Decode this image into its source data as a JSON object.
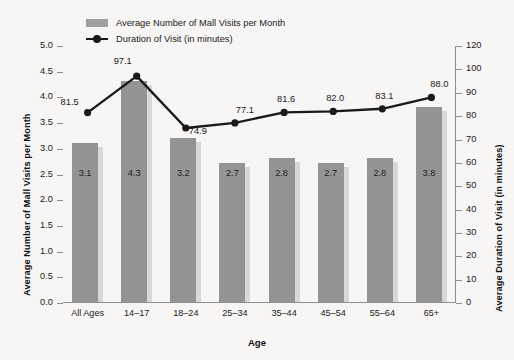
{
  "chart_data": {
    "type": "bar",
    "title": "",
    "xlabel": "Age",
    "ylabel": "Average Number of Mall Visits per Month",
    "y2label": "Average Duration of Visit (in minutes)",
    "categories": [
      "All Ages",
      "14–17",
      "18–24",
      "25–34",
      "35–44",
      "45–54",
      "55–64",
      "65+"
    ],
    "ylim": [
      0,
      5
    ],
    "y2lim": [
      0,
      120
    ],
    "grid": false,
    "legend_position": "top-left",
    "yticks": [
      "0.0",
      "0.5",
      "1.0",
      "1.5",
      "2.0",
      "2.5",
      "3.0",
      "3.5",
      "4.0",
      "4.5",
      "5.0"
    ],
    "ytick_values": [
      0,
      0.5,
      1,
      1.5,
      2,
      2.5,
      3,
      3.5,
      4,
      4.5,
      5
    ],
    "y2ticks": [
      "0",
      "10",
      "20",
      "30",
      "40",
      "50",
      "60",
      "70",
      "80",
      "90",
      "100",
      "120"
    ],
    "y2tick_values": [
      0,
      10,
      20,
      30,
      40,
      50,
      60,
      70,
      80,
      90,
      100,
      120
    ],
    "series": [
      {
        "name": "Average Number of Mall Visits per Month",
        "type": "bar",
        "axis": "left",
        "color": "#949494",
        "shadow_color": "#d9d8d6",
        "values": [
          3.1,
          4.3,
          3.2,
          2.7,
          2.8,
          2.7,
          2.8,
          3.8
        ],
        "labels": [
          "3.1",
          "4.3",
          "3.2",
          "2.7",
          "2.8",
          "2.7",
          "2.8",
          "3.8"
        ]
      },
      {
        "name": "Duration of Visit (in minutes)",
        "type": "line",
        "axis": "right",
        "color": "#1a1a1a",
        "values": [
          81.5,
          97.1,
          74.9,
          77.1,
          81.6,
          82.0,
          83.1,
          88.0
        ],
        "labels": [
          "81.5",
          "97.1",
          "74.9",
          "77.1",
          "81.6",
          "82.0",
          "83.1",
          "88.0"
        ]
      }
    ]
  },
  "legend": {
    "items": [
      {
        "label": "Average Number of Mall Visits per Month",
        "marker": "swatch"
      },
      {
        "label": "Duration of Visit (in minutes)",
        "marker": "line-marker"
      }
    ]
  },
  "colors": {
    "background": "#f7f6f4",
    "bar": "#949494",
    "bar_shadow": "#d9d8d6",
    "line": "#1a1a1a",
    "axis": "#8e8e8e",
    "text": "#1a1a1a"
  }
}
